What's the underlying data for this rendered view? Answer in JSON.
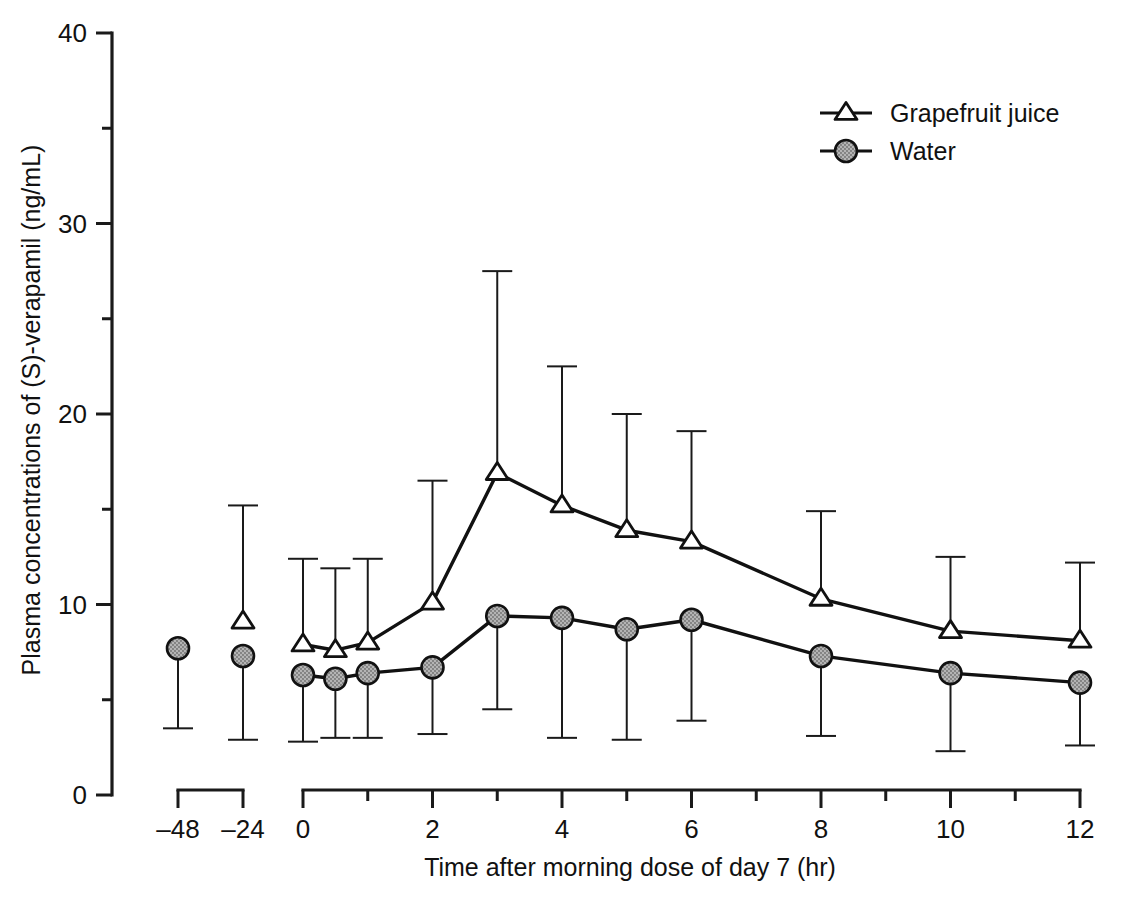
{
  "figure": {
    "background": "#ffffff",
    "ink_color": "#111111",
    "marker_fill_gray": "#a9a9a9",
    "caption_fragment": ""
  },
  "chart_data": {
    "type": "line",
    "title": "",
    "xlabel": "Time after morning dose of day 7 (hr)",
    "ylabel": "Plasma concentrations of (S)-verapamil (ng/mL)",
    "ylim": [
      0,
      40
    ],
    "ytick_major": [
      0,
      10,
      20,
      30,
      40
    ],
    "ytick_minor": [
      5,
      15,
      25,
      35
    ],
    "ytick_labels": [
      "0",
      "10",
      "20",
      "30",
      "40"
    ],
    "grid": false,
    "legend_position": "top-right",
    "axis_break": true,
    "predose_xticks": [
      -48,
      -24
    ],
    "predose_xtick_labels": [
      "–48",
      "–24"
    ],
    "main_xticks": [
      0,
      1,
      2,
      3,
      4,
      5,
      6,
      7,
      8,
      9,
      10,
      11,
      12
    ],
    "main_xtick_labels": [
      "0",
      "",
      "2",
      "",
      "4",
      "",
      "6",
      "",
      "8",
      "",
      "10",
      "",
      "12"
    ],
    "errorbar_type": "SD",
    "series": [
      {
        "name": "Grapefruit juice",
        "marker": "open-triangle",
        "x": [
          -24,
          0,
          0.5,
          1,
          2,
          3,
          4,
          5,
          6,
          8,
          10,
          12
        ],
        "values": [
          9.1,
          7.9,
          7.6,
          8.0,
          10.1,
          16.9,
          15.2,
          13.9,
          13.3,
          10.3,
          8.6,
          8.1
        ],
        "err_high": [
          15.2,
          12.4,
          11.9,
          12.4,
          16.5,
          27.5,
          22.5,
          20.0,
          19.1,
          14.9,
          12.5,
          12.2
        ],
        "err_low": [
          2.9,
          2.8,
          3.0,
          3.0,
          3.2,
          4.5,
          3.0,
          2.9,
          3.9,
          3.1,
          2.3,
          2.6
        ]
      },
      {
        "name": "Water",
        "marker": "filled-circle",
        "x": [
          -48,
          -24,
          0,
          0.5,
          1,
          2,
          3,
          4,
          5,
          6,
          8,
          10,
          12
        ],
        "values": [
          7.7,
          7.3,
          6.3,
          6.1,
          6.4,
          6.7,
          9.4,
          9.3,
          8.7,
          9.2,
          7.3,
          6.4,
          5.9
        ],
        "err_high": [
          13.5,
          15.2,
          12.4,
          11.9,
          12.4,
          16.5,
          9.4,
          9.3,
          8.7,
          9.2,
          7.3,
          6.4,
          5.9
        ],
        "err_low": [
          3.5,
          2.9,
          2.8,
          3.0,
          3.0,
          3.2,
          4.5,
          3.0,
          2.9,
          3.9,
          3.1,
          2.3,
          2.6
        ]
      }
    ],
    "legend": [
      {
        "label": "Grapefruit juice",
        "marker": "open-triangle"
      },
      {
        "label": "Water",
        "marker": "filled-circle"
      }
    ]
  }
}
